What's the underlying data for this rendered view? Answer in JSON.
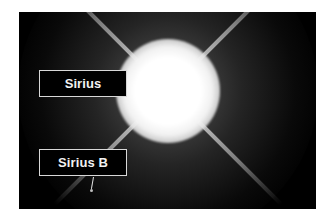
{
  "image": {
    "description": "Astronomical photograph of the bright star Sirius with diffraction spikes and its faint companion Sirius B",
    "background_color": "#000000",
    "frame_color": "#ffffff"
  },
  "labels": {
    "primary": "Sirius",
    "companion": "Sirius B"
  }
}
